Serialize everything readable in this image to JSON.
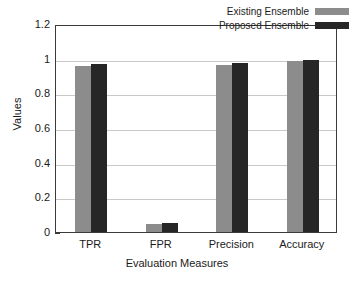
{
  "chart_data": {
    "type": "bar",
    "title": "",
    "xlabel": "Evaluation Measures",
    "ylabel": "Values",
    "categories": [
      "TPR",
      "FPR",
      "Precision",
      "Accuracy"
    ],
    "series": [
      {
        "name": "Existing Ensemble",
        "color": "#8c8c8c",
        "values": [
          0.955,
          0.045,
          0.962,
          0.985
        ]
      },
      {
        "name": "Proposed Ensemble",
        "color": "#262626",
        "values": [
          0.972,
          0.052,
          0.977,
          0.991
        ]
      }
    ],
    "ylim": [
      0,
      1.2
    ],
    "yticks": [
      "0",
      "0.2",
      "0.4",
      "0.6",
      "0.8",
      "1",
      "1.2"
    ],
    "ytick_values": [
      0,
      0.2,
      0.4,
      0.6,
      0.8,
      1,
      1.2
    ],
    "grid": "horizontal",
    "legend_position": "top-right"
  },
  "legend": {
    "entries": [
      {
        "label": "Existing Ensemble",
        "color": "#8c8c8c"
      },
      {
        "label": "Proposed Ensemble",
        "color": "#262626"
      }
    ]
  }
}
